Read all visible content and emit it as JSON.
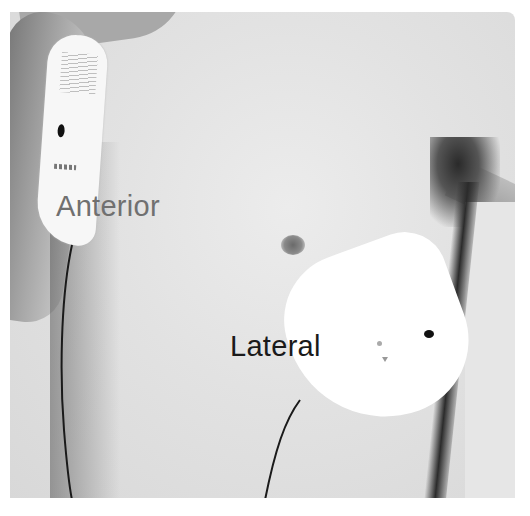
{
  "image": {
    "description": "Grayscale photo of a male torso with two defibrillator electrode pads in anterior-lateral placement",
    "labels": {
      "anterior": "Anterior",
      "lateral": "Lateral"
    },
    "colors": {
      "skin": "#e2e2e2",
      "pad": "#ffffff",
      "anterior_label": "#707070",
      "lateral_label": "#1a1a1a",
      "cable": "#1a1a1a"
    }
  }
}
